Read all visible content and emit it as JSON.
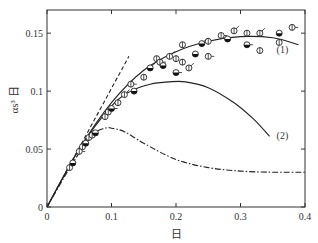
{
  "chart_data": {
    "type": "line",
    "title": "",
    "xlabel": "日",
    "ylabel": "αs³ 日",
    "xlim": [
      0,
      0.4
    ],
    "ylim": [
      0,
      0.17
    ],
    "xticks": [
      0,
      0.1,
      0.2,
      0.3,
      0.4
    ],
    "xtick_labels": [
      "0",
      "0.1",
      "0.2",
      "0.3",
      "0.4"
    ],
    "yticks": [
      0,
      0.05,
      0.1,
      0.15
    ],
    "ytick_labels": [
      "0",
      "0.05",
      "0.1",
      "0.15"
    ],
    "grid": false,
    "legend": "none",
    "annotations": [
      {
        "text": "(1)",
        "x": 0.365,
        "y": 0.133
      },
      {
        "text": "(2)",
        "x": 0.365,
        "y": 0.059
      }
    ],
    "series": [
      {
        "name": "curve (1)",
        "style": "solid",
        "x": [
          0,
          0.05,
          0.1,
          0.15,
          0.2,
          0.25,
          0.3,
          0.35,
          0.39
        ],
        "y": [
          0,
          0.05,
          0.09,
          0.118,
          0.134,
          0.143,
          0.147,
          0.146,
          0.14
        ]
      },
      {
        "name": "curve (2)",
        "style": "solid",
        "x": [
          0,
          0.05,
          0.1,
          0.13,
          0.16,
          0.19,
          0.215,
          0.25,
          0.29,
          0.32,
          0.345
        ],
        "y": [
          0,
          0.05,
          0.087,
          0.1,
          0.106,
          0.108,
          0.108,
          0.103,
          0.09,
          0.076,
          0.061
        ]
      },
      {
        "name": "dashed asymptote",
        "style": "dashed",
        "x": [
          0,
          0.127
        ],
        "y": [
          0,
          0.13
        ]
      },
      {
        "name": "dash-dot curve",
        "style": "dashdot",
        "x": [
          0,
          0.04,
          0.07,
          0.09,
          0.1,
          0.12,
          0.15,
          0.2,
          0.25,
          0.3,
          0.35,
          0.4
        ],
        "y": [
          0,
          0.038,
          0.062,
          0.068,
          0.068,
          0.065,
          0.055,
          0.041,
          0.034,
          0.031,
          0.03,
          0.03
        ]
      },
      {
        "name": "experimental data",
        "style": "markers",
        "x": [
          0.035,
          0.04,
          0.05,
          0.055,
          0.06,
          0.065,
          0.07,
          0.075,
          0.09,
          0.095,
          0.1,
          0.11,
          0.12,
          0.135,
          0.13,
          0.15,
          0.16,
          0.17,
          0.175,
          0.18,
          0.19,
          0.2,
          0.2,
          0.21,
          0.22,
          0.23,
          0.25,
          0.21,
          0.24,
          0.25,
          0.27,
          0.28,
          0.29,
          0.31,
          0.31,
          0.33,
          0.33,
          0.36,
          0.38,
          0.36
        ],
        "y": [
          0.034,
          0.038,
          0.048,
          0.052,
          0.055,
          0.06,
          0.062,
          0.064,
          0.078,
          0.082,
          0.085,
          0.09,
          0.097,
          0.1,
          0.106,
          0.112,
          0.12,
          0.128,
          0.125,
          0.122,
          0.13,
          0.128,
          0.116,
          0.125,
          0.12,
          0.132,
          0.13,
          0.14,
          0.141,
          0.143,
          0.148,
          0.145,
          0.152,
          0.15,
          0.14,
          0.135,
          0.15,
          0.15,
          0.155,
          0.142
        ]
      }
    ]
  }
}
